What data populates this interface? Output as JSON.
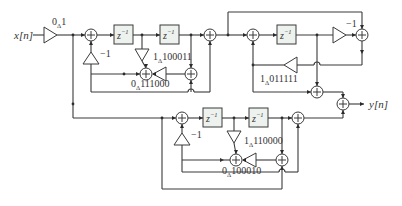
{
  "diagram": {
    "input_label": "x[n]",
    "output_label": "y[n]",
    "delay_label": "z",
    "delay_exp": "−1",
    "input_gain": {
      "pre": "0",
      "sub": "Δ",
      "post": "1"
    },
    "upper_section": {
      "feedback_gain": "−1",
      "coef_a": {
        "pre": "1",
        "sub": "Δ",
        "post": "100011"
      },
      "coef_b": {
        "pre": "0",
        "sub": "Δ",
        "post": "111000"
      }
    },
    "right_section": {
      "forward_gain": "−1",
      "coef": {
        "pre": "1",
        "sub": "Δ",
        "post": "011111"
      }
    },
    "lower_section": {
      "feedback_gain": "−1",
      "coef_a": {
        "pre": "1",
        "sub": "Δ",
        "post": "110000"
      },
      "coef_b": {
        "pre": "0",
        "sub": "Δ",
        "post": "100010"
      }
    }
  }
}
